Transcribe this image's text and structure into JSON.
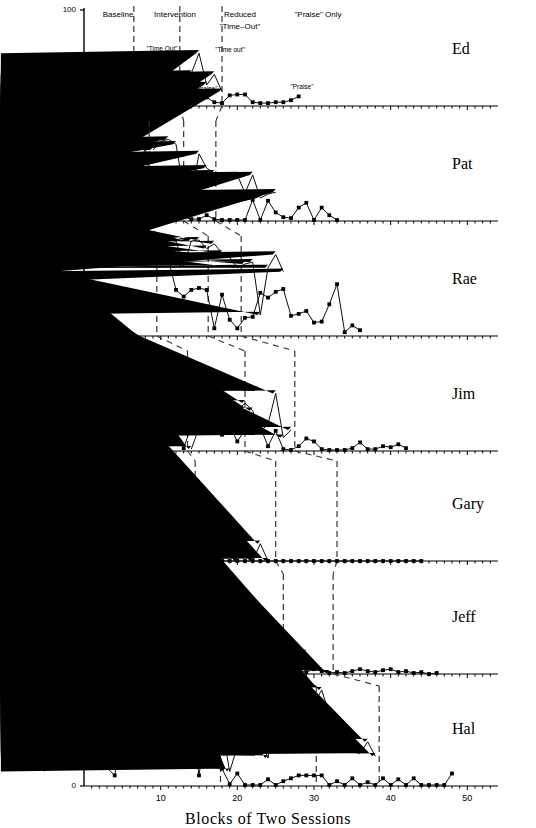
{
  "figure": {
    "ylabel": "Percent of Intervals — Problem Behavior",
    "xlabel": "Blocks of Two Sessions",
    "xticks": [
      10,
      20,
      30,
      40,
      50
    ],
    "yticks": [
      0,
      50,
      100
    ],
    "xlim": [
      0,
      54
    ],
    "ylim": [
      0,
      100
    ],
    "series_marker_primary": "square",
    "series_marker_secondary": "triangle",
    "line_color": "#000000",
    "divider_style": "dashed"
  },
  "phase_headers": [
    {
      "label": "Baseline",
      "x": 118
    },
    {
      "label": "Intervention",
      "x": 175
    },
    {
      "label": "Reduced",
      "x": 240
    },
    {
      "label": "\"Time–Out\"",
      "x": 240
    },
    {
      "label": "\"Praise\" Only",
      "x": 318
    }
  ],
  "annotations_ed": [
    {
      "label": "\"Time Out\"",
      "x": 160,
      "y": 45
    },
    {
      "label": "\"Time out\"",
      "x": 228,
      "y": 46
    },
    {
      "label": "\"Praise\"",
      "x": 166,
      "y": 85
    },
    {
      "label": "\"Praise\"",
      "x": 204,
      "y": 85
    },
    {
      "label": "\"Praise\"",
      "x": 300,
      "y": 83
    }
  ],
  "chart_data": {
    "type": "line",
    "title": "",
    "xlabel": "Blocks of Two Sessions",
    "ylabel": "Percent of Intervals — Problem Behavior",
    "xlim": [
      0,
      54
    ],
    "ylim": [
      0,
      100
    ],
    "grid": false,
    "legend": "none",
    "panels": [
      {
        "subject": "Ed",
        "ylabel": "Aggression",
        "dividers": [
          6.5,
          12.5,
          18.0
        ],
        "phases": [
          "Baseline",
          "Intervention",
          "Reduced \"Time-Out\"",
          "\"Praise\" Only"
        ],
        "series": [
          {
            "name": "Problem Behavior",
            "marker": "square",
            "x": [
              2,
              3,
              4,
              5,
              6,
              7,
              8,
              9,
              10,
              11,
              12,
              13,
              14,
              15,
              16,
              17,
              18,
              19,
              20,
              21,
              22,
              23,
              24,
              25,
              26,
              27,
              28
            ],
            "values": [
              4,
              12,
              3,
              3,
              3,
              18,
              4,
              3,
              9,
              4,
              6,
              9,
              9,
              7,
              9,
              4,
              3,
              11,
              12,
              12,
              4,
              3,
              3,
              4,
              4,
              6,
              10
            ]
          },
          {
            "name": "\"Time Out\" / Treatment",
            "marker": "triangle",
            "x": [
              7,
              8,
              9,
              10,
              11,
              12,
              13,
              14,
              15,
              16,
              17,
              18
            ],
            "values": [
              4,
              20,
              25,
              23,
              37,
              25,
              32,
              34,
              55,
              22,
              33,
              15
            ]
          }
        ]
      },
      {
        "subject": "Pat",
        "ylabel": "Tantrums",
        "dividers": [
          8.5,
          13.0,
          17.2
        ],
        "series": [
          {
            "name": "Problem Behavior",
            "marker": "square",
            "x": [
              2,
              3,
              4,
              5,
              6,
              7,
              8,
              9,
              10,
              11,
              12,
              13,
              14,
              15,
              16,
              17,
              18,
              19,
              20,
              21,
              22,
              23,
              24,
              25,
              26,
              27,
              28,
              29,
              30,
              31,
              32,
              33
            ],
            "values": [
              48,
              13,
              61,
              57,
              72,
              39,
              78,
              19,
              1,
              11,
              19,
              4,
              2,
              2,
              6,
              2,
              1,
              1,
              1,
              1,
              22,
              1,
              21,
              9,
              4,
              3,
              14,
              19,
              1,
              14,
              6,
              1
            ]
          },
          {
            "name": "Treatment",
            "marker": "triangle",
            "x": [
              9,
              10,
              11,
              12,
              13,
              14,
              15,
              16,
              17,
              18,
              19,
              20,
              21,
              22,
              23,
              24,
              25
            ],
            "values": [
              74,
              83,
              85,
              80,
              32,
              27,
              70,
              55,
              50,
              44,
              47,
              48,
              29,
              48,
              24,
              28,
              30
            ]
          }
        ]
      },
      {
        "subject": "Rae",
        "ylabel": "Self–Injury",
        "dividers": [
          9.5,
          16.2,
          20.5
        ],
        "series": [
          {
            "name": "Problem Behavior",
            "marker": "square",
            "x": [
              2,
              3,
              4,
              5,
              6,
              7,
              8,
              9,
              10,
              11,
              12,
              13,
              14,
              15,
              16,
              17,
              18,
              19,
              20,
              21,
              22,
              23,
              24,
              25,
              26,
              27,
              28,
              29,
              30,
              31,
              32,
              33,
              34,
              35,
              36
            ],
            "values": [
              91,
              81,
              85,
              96,
              81,
              92,
              95,
              96,
              79,
              80,
              48,
              41,
              48,
              50,
              48,
              8,
              43,
              17,
              8,
              19,
              20,
              45,
              40,
              46,
              49,
              21,
              23,
              26,
              14,
              15,
              33,
              54,
              4,
              11,
              6
            ]
          },
          {
            "name": "Treatment",
            "marker": "triangle",
            "x": [
              10,
              11,
              12,
              13,
              14,
              15,
              16,
              17,
              18,
              19,
              20,
              21,
              22,
              23,
              24,
              25,
              26
            ],
            "values": [
              96,
              100,
              99,
              73,
              99,
              100,
              91,
              96,
              86,
              82,
              71,
              75,
              77,
              22,
              71,
              85,
              67
            ]
          }
        ]
      },
      {
        "subject": "Jim",
        "ylabel": "Aggression",
        "dividers": [
          13.5,
          21.0,
          27.5
        ],
        "series": [
          {
            "name": "Problem Behavior",
            "marker": "square",
            "x": [
              2,
              3,
              4,
              5,
              6,
              7,
              8,
              9,
              10,
              11,
              12,
              13,
              14,
              15,
              16,
              17,
              18,
              19,
              20,
              21,
              22,
              23,
              24,
              25,
              26,
              27,
              28,
              29,
              30,
              31,
              32,
              33,
              34,
              35,
              36,
              37,
              38,
              39,
              40,
              41,
              42
            ],
            "values": [
              27,
              1,
              18,
              23,
              30,
              26,
              18,
              27,
              12,
              21,
              20,
              3,
              26,
              22,
              24,
              26,
              17,
              27,
              10,
              22,
              22,
              25,
              5,
              21,
              2,
              1,
              5,
              13,
              10,
              2,
              1,
              1,
              1,
              3,
              9,
              2,
              2,
              5,
              4,
              7,
              3
            ]
          },
          {
            "name": "Treatment",
            "marker": "triangle",
            "x": [
              14,
              15,
              16,
              17,
              18,
              19,
              20,
              21,
              22,
              23,
              24,
              25,
              26,
              27
            ],
            "values": [
              2,
              24,
              29,
              33,
              50,
              27,
              42,
              50,
              42,
              20,
              28,
              60,
              14,
              22
            ]
          }
        ]
      },
      {
        "subject": "Gary",
        "ylabel": "Tantrums",
        "dividers": [
          14.5,
          25.0,
          33.0
        ],
        "series": [
          {
            "name": "Problem Behavior",
            "marker": "square",
            "x": [
              3,
              4,
              5,
              6,
              7,
              8,
              9,
              10,
              11,
              12,
              13,
              14,
              15,
              16,
              17,
              18,
              19,
              20,
              21,
              22,
              23,
              24,
              25,
              26,
              27,
              28,
              29,
              30,
              31,
              32,
              33,
              34,
              35,
              36,
              37,
              38,
              39,
              40,
              41,
              42,
              43,
              44
            ],
            "values": [
              0,
              0,
              0,
              0,
              0,
              0,
              0,
              0,
              0,
              0,
              0,
              0,
              0,
              0,
              0,
              0,
              0,
              0,
              0,
              0,
              0,
              0,
              0,
              0,
              0,
              0,
              0,
              0,
              0,
              0,
              0,
              0,
              0,
              0,
              0,
              0,
              0,
              0,
              0,
              0,
              0,
              0
            ]
          },
          {
            "name": "Treatment",
            "marker": "triangle",
            "x": [
              18,
              19,
              20,
              21,
              22,
              23,
              24
            ],
            "values": [
              0,
              13,
              0,
              22,
              0,
              18,
              0
            ]
          }
        ]
      },
      {
        "subject": "Jeff",
        "ylabel": "Tantrums",
        "dividers": [
          16.0,
          26.0,
          32.5
        ],
        "series": [
          {
            "name": "Problem Behavior",
            "marker": "square",
            "x": [
              3,
              4,
              5,
              6,
              7,
              8,
              9,
              10,
              11,
              12,
              13,
              14,
              15,
              16,
              17,
              18,
              19,
              20,
              21,
              22,
              23,
              24,
              25,
              26,
              27,
              28,
              29,
              30,
              31,
              32,
              33,
              34,
              35,
              36,
              37,
              38,
              39,
              40,
              41,
              42,
              43,
              44,
              45,
              46
            ],
            "values": [
              11,
              1,
              4,
              5,
              16,
              9,
              11,
              11,
              0,
              0,
              8,
              9,
              10,
              11,
              2,
              1,
              3,
              7,
              5,
              6,
              7,
              2,
              2,
              2,
              2,
              3,
              2,
              5,
              3,
              1,
              2,
              1,
              3,
              5,
              3,
              2,
              4,
              5,
              2,
              3,
              1,
              2,
              0,
              1
            ]
          },
          {
            "name": "Treatment",
            "marker": "triangle",
            "x": [
              16,
              17,
              18,
              19,
              20,
              21,
              22,
              23,
              24,
              25,
              26,
              27,
              28,
              29,
              30,
              31,
              32
            ],
            "values": [
              1,
              30,
              46,
              11,
              25,
              22,
              21,
              49,
              58,
              15,
              23,
              14,
              24,
              22,
              5,
              4,
              1
            ]
          }
        ]
      },
      {
        "subject": "Hal",
        "ylabel": "Tantrums",
        "dividers": [
          17.8,
          30.3,
          38.5
        ],
        "series": [
          {
            "name": "Problem Behavior",
            "marker": "square",
            "x": [
              2,
              3,
              4,
              5,
              6,
              7,
              8,
              9,
              10,
              11,
              12,
              13,
              14,
              15,
              16,
              17,
              18,
              19,
              20,
              21,
              22,
              23,
              24,
              25,
              26,
              27,
              28,
              29,
              30,
              31,
              32,
              33,
              34,
              35,
              36,
              37,
              38,
              39,
              40,
              41,
              42,
              43,
              44,
              45,
              46,
              47,
              48
            ],
            "values": [
              33,
              19,
              11,
              58,
              70,
              34,
              33,
              50,
              31,
              42,
              46,
              43,
              70,
              11,
              66,
              47,
              18,
              2,
              13,
              1,
              1,
              1,
              7,
              1,
              5,
              8,
              11,
              11,
              11,
              11,
              1,
              5,
              1,
              8,
              1,
              4,
              1,
              8,
              1,
              7,
              1,
              8,
              1,
              1,
              1,
              1,
              13
            ]
          },
          {
            "name": "Treatment",
            "marker": "triangle",
            "x": [
              18,
              19,
              20,
              21,
              22,
              23,
              24,
              25,
              26,
              27,
              28,
              29,
              30,
              31,
              32,
              33,
              34,
              35,
              36,
              37,
              38
            ],
            "values": [
              62,
              15,
              41,
              74,
              86,
              48,
              29,
              73,
              93,
              93,
              57,
              67,
              86,
              100,
              75,
              55,
              64,
              36,
              34,
              46,
              31
            ]
          }
        ]
      }
    ]
  }
}
